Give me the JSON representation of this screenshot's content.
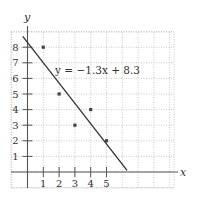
{
  "chart_data": {
    "type": "scatter",
    "title": "",
    "xlabel": "x",
    "ylabel": "y",
    "x_ticks": [
      1,
      2,
      3,
      4,
      5
    ],
    "y_ticks": [
      1,
      2,
      3,
      4,
      5,
      6,
      7,
      8
    ],
    "xlim": [
      -1,
      9
    ],
    "ylim": [
      -1,
      9
    ],
    "grid": true,
    "series": [
      {
        "name": "data points",
        "type": "scatter",
        "points": [
          {
            "x": 1,
            "y": 8
          },
          {
            "x": 2,
            "y": 5
          },
          {
            "x": 3,
            "y": 3
          },
          {
            "x": 4,
            "y": 4
          },
          {
            "x": 5,
            "y": 2
          }
        ]
      },
      {
        "name": "regression line",
        "type": "line",
        "slope": -1.3,
        "intercept": 8.3,
        "x_range": [
          -0.3,
          6.3
        ]
      }
    ],
    "annotations": [
      {
        "text": "y = −1.3x + 8.3",
        "x": 2.2,
        "y": 6.5
      }
    ]
  },
  "labels": {
    "x_axis": "x",
    "y_axis": "y",
    "equation": "y = −1.3x + 8.3"
  },
  "colors": {
    "axis": "#555555",
    "grid": "#bbbbbb",
    "line": "#333333",
    "point": "#444444"
  }
}
